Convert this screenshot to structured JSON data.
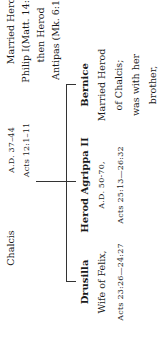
{
  "top_row": {
    "col1": {
      "line1": "Chalcis"
    },
    "col2": {
      "line1": "A.D. 37–44",
      "line2": "Acts 12:1–11"
    },
    "col3": {
      "line1": "Married Herod",
      "line2": "Philip I(Matt. 14:3),",
      "line3": "then Herod",
      "line4": "Antipas (Mk. 6:17)"
    }
  },
  "children": [
    {
      "name": "Drusilla",
      "line1": "Wife of Felix,",
      "line2": "Acts 23:26—24:27"
    },
    {
      "name": "Herod Agrippa II",
      "line1": "A.D. 50-70,",
      "line2": "Acts 25:13—26:32"
    },
    {
      "name": "Bernice",
      "line1": "Married Herod",
      "line2": "of Chalcis;",
      "line3": "was with her",
      "line4": "brother,"
    }
  ]
}
